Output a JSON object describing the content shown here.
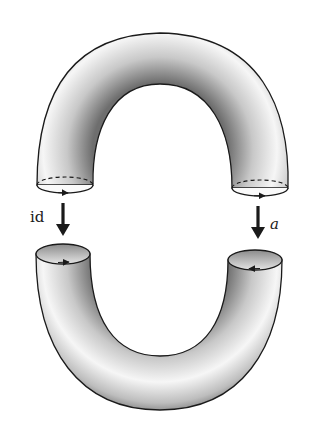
{
  "figure": {
    "top_piece": {
      "shape": "arch",
      "end_circles": [
        "left-oriented-right",
        "right-oriented-right"
      ]
    },
    "bottom_piece": {
      "shape": "u-tube",
      "end_circles": [
        "left-oriented-right",
        "right-oriented-left"
      ]
    },
    "maps": [
      {
        "side": "left",
        "label": "id"
      },
      {
        "side": "right",
        "label": "a"
      }
    ],
    "colors": {
      "ink": "#1a1a1a",
      "shade_dark": "#6e6e6e",
      "shade_light": "#f4f4f4",
      "background": "#ffffff"
    }
  }
}
